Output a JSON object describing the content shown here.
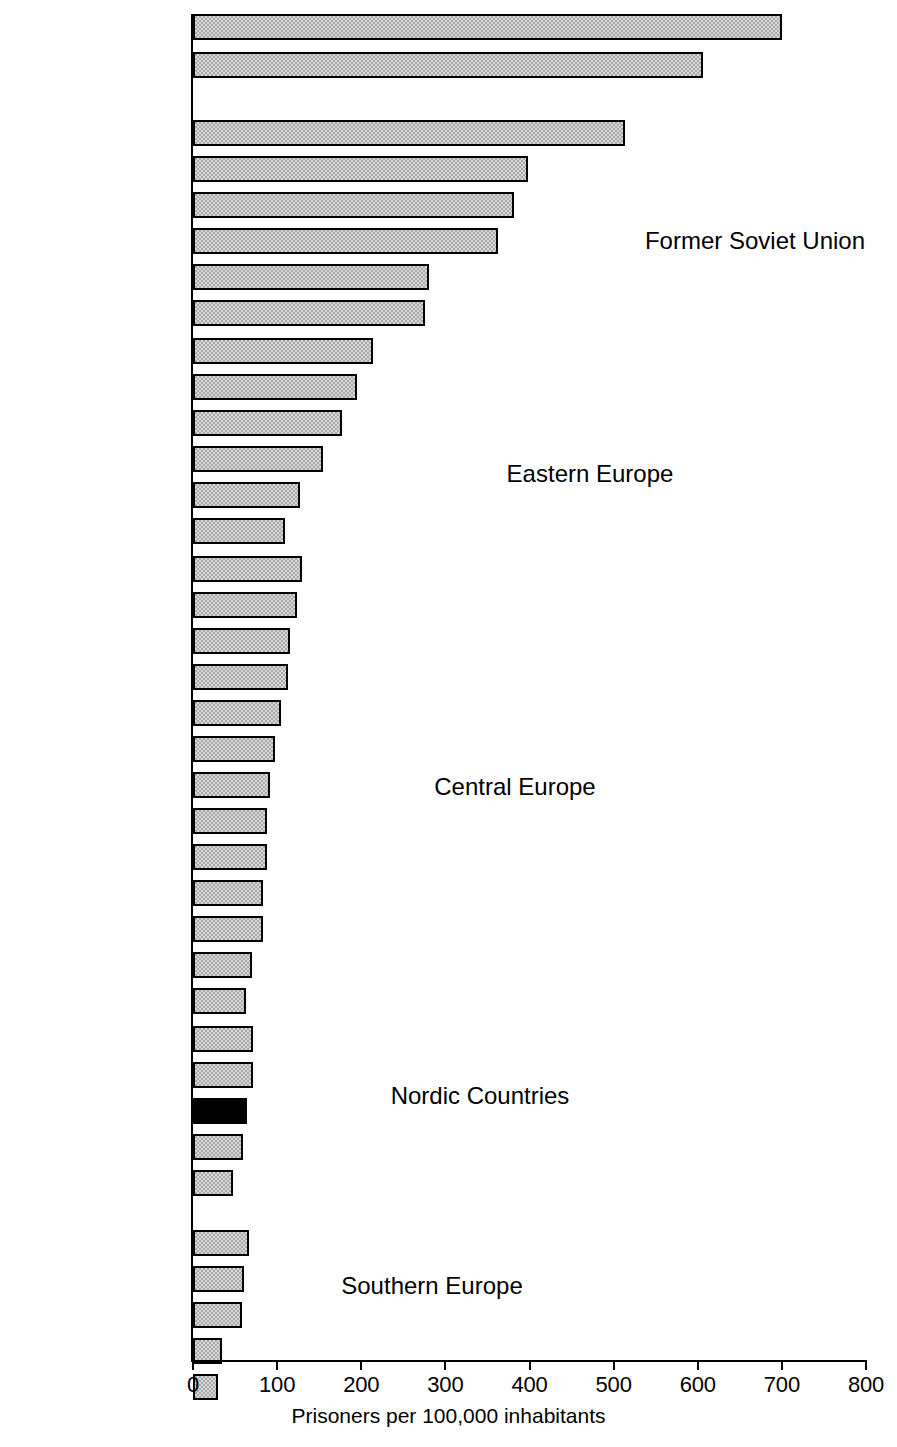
{
  "chart_data": {
    "type": "bar",
    "orientation": "horizontal",
    "title": "",
    "xlabel": "Prisoners per 100,000 inhabitants",
    "ylabel": "",
    "xlim": [
      0,
      800
    ],
    "xticks": [
      0,
      100,
      200,
      300,
      400,
      500,
      600,
      700,
      800
    ],
    "xtick_labels": [
      "0",
      "100",
      "200",
      "300",
      "400",
      "500",
      "600",
      "700",
      "800"
    ],
    "grid": false,
    "legend": null,
    "highlight_category": "FINLAND",
    "highlight_color": "#000000",
    "bar_color": "#a9a9a9",
    "bar_edge_color": "#000000",
    "categories": [
      "Russian Federation",
      "USA",
      "Belarus",
      "Ukraine",
      "Latvia",
      "Lithuania",
      "Moldova",
      "Estonia",
      "Romania",
      "Czech Republic",
      "Poland",
      "Slovakia",
      "Hungary",
      "Bulgaria",
      "Portugal",
      "Spain",
      "Scotland",
      "Northern Ireland",
      "England/Wales",
      "France",
      "Italy",
      "Switzerland",
      "Germany",
      "Belgium",
      "Austria",
      "Netherlands",
      "Ireland",
      "Sweden",
      "Denmark",
      "FINLAND",
      "Norway",
      "Iceland",
      "Malta",
      "Croatia",
      "FYR Macedonia",
      "Slovenia",
      "Cyprus"
    ],
    "values": [
      700,
      606,
      514,
      398,
      381,
      363,
      280,
      276,
      214,
      195,
      177,
      155,
      127,
      109,
      130,
      124,
      115,
      113,
      105,
      98,
      91,
      88,
      88,
      83,
      83,
      70,
      63,
      71,
      71,
      64,
      60,
      48,
      67,
      61,
      58,
      34,
      30
    ],
    "groups": [
      {
        "name": "Former Soviet Union",
        "label_x": 755,
        "label_y": 242,
        "bars": [
          {
            "category": "Russian Federation",
            "value": 700,
            "highlight": false,
            "y": 18
          },
          {
            "category": "USA",
            "value": 606,
            "highlight": false,
            "y": 56
          }
        ]
      },
      {
        "name": "",
        "label_x": 0,
        "label_y": 0,
        "bars": [
          {
            "category": "Belarus",
            "value": 514,
            "highlight": false,
            "y": 124
          },
          {
            "category": "Ukraine",
            "value": 398,
            "highlight": false,
            "y": 160
          },
          {
            "category": "Latvia",
            "value": 381,
            "highlight": false,
            "y": 196
          },
          {
            "category": "Lithuania",
            "value": 363,
            "highlight": false,
            "y": 232
          },
          {
            "category": "Moldova",
            "value": 280,
            "highlight": false,
            "y": 268
          },
          {
            "category": "Estonia",
            "value": 276,
            "highlight": false,
            "y": 304
          }
        ]
      },
      {
        "name": "Eastern Europe",
        "label_x": 590,
        "label_y": 475,
        "bars": [
          {
            "category": "Romania",
            "value": 214,
            "highlight": false,
            "y": 342
          },
          {
            "category": "Czech Republic",
            "value": 195,
            "highlight": false,
            "y": 378
          },
          {
            "category": "Poland",
            "value": 177,
            "highlight": false,
            "y": 414
          },
          {
            "category": "Slovakia",
            "value": 155,
            "highlight": false,
            "y": 450
          },
          {
            "category": "Hungary",
            "value": 127,
            "highlight": false,
            "y": 486
          },
          {
            "category": "Bulgaria",
            "value": 109,
            "highlight": false,
            "y": 522
          }
        ]
      },
      {
        "name": "Central Europe",
        "label_x": 515,
        "label_y": 788,
        "bars": [
          {
            "category": "Portugal",
            "value": 130,
            "highlight": false,
            "y": 560
          },
          {
            "category": "Spain",
            "value": 124,
            "highlight": false,
            "y": 596
          },
          {
            "category": "Scotland",
            "value": 115,
            "highlight": false,
            "y": 632
          },
          {
            "category": "Northern Ireland",
            "value": 113,
            "highlight": false,
            "y": 668
          },
          {
            "category": "England/Wales",
            "value": 105,
            "highlight": false,
            "y": 704
          },
          {
            "category": "France",
            "value": 98,
            "highlight": false,
            "y": 740
          },
          {
            "category": "Italy",
            "value": 91,
            "highlight": false,
            "y": 776
          },
          {
            "category": "Switzerland",
            "value": 88,
            "highlight": false,
            "y": 812
          },
          {
            "category": "Germany",
            "value": 88,
            "highlight": false,
            "y": 848
          },
          {
            "category": "Belgium",
            "value": 83,
            "highlight": false,
            "y": 884
          },
          {
            "category": "Austria",
            "value": 83,
            "highlight": false,
            "y": 920
          },
          {
            "category": "Netherlands",
            "value": 70,
            "highlight": false,
            "y": 956
          },
          {
            "category": "Ireland",
            "value": 63,
            "highlight": false,
            "y": 992
          }
        ]
      },
      {
        "name": "Nordic Countries",
        "label_x": 480,
        "label_y": 1097,
        "bars": [
          {
            "category": "Sweden",
            "value": 71,
            "highlight": false,
            "y": 1030
          },
          {
            "category": "Denmark",
            "value": 71,
            "highlight": false,
            "y": 1066
          },
          {
            "category": "FINLAND",
            "value": 64,
            "highlight": true,
            "y": 1102
          },
          {
            "category": "Norway",
            "value": 60,
            "highlight": false,
            "y": 1138
          },
          {
            "category": "Iceland",
            "value": 48,
            "highlight": false,
            "y": 1174
          }
        ]
      },
      {
        "name": "Southern Europe",
        "label_x": 432,
        "label_y": 1287,
        "bars": [
          {
            "category": "Malta",
            "value": 67,
            "highlight": false,
            "y": 1234
          },
          {
            "category": "Croatia",
            "value": 61,
            "highlight": false,
            "y": 1270
          },
          {
            "category": "FYR Macedonia",
            "value": 58,
            "highlight": false,
            "y": 1306
          },
          {
            "category": "Slovenia",
            "value": 34,
            "highlight": false,
            "y": 1342
          },
          {
            "category": "Cyprus",
            "value": 30,
            "highlight": false,
            "y": 1378
          }
        ]
      }
    ]
  }
}
